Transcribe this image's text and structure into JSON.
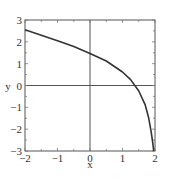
{
  "chart_data": {
    "type": "line",
    "title": "",
    "xlabel": "x",
    "ylabel": "y",
    "xlim": [
      -2,
      2
    ],
    "ylim": [
      -3,
      3
    ],
    "grid": false,
    "xticks": [
      "-2",
      "-1",
      "0",
      "1",
      "2"
    ],
    "yticks": [
      "-3",
      "-2",
      "-1",
      "0",
      "1",
      "2",
      "3"
    ],
    "series": [
      {
        "name": "curve",
        "x": [
          -2,
          -1.5,
          -1,
          -0.5,
          0,
          0.5,
          1,
          1.25,
          1.5,
          1.7,
          1.8,
          1.88,
          1.93,
          1.96
        ],
        "y": [
          2.55,
          2.3,
          2.05,
          1.78,
          1.47,
          1.12,
          0.62,
          0.27,
          -0.25,
          -0.9,
          -1.45,
          -2.1,
          -2.6,
          -3.0
        ]
      }
    ]
  }
}
